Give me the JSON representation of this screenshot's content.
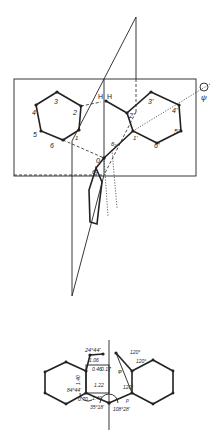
{
  "figure": {
    "top": {
      "labels_left_ring": [
        "2",
        "3",
        "4",
        "5",
        "6",
        "1"
      ],
      "labels_right_ring": [
        "2'",
        "3'",
        "4'",
        "5'",
        "6'",
        "1'"
      ],
      "hydrogen_labels": [
        "H",
        "H"
      ],
      "axis_symbol": "ψ",
      "oxygen_label": "0",
      "lower_ring_labels": [
        "6₁",
        "6₂"
      ]
    },
    "bottom": {
      "angles": [
        "24°44'",
        "84°44'",
        "35°18'",
        "108°28'",
        "120°",
        "120°",
        "120°"
      ],
      "distances": [
        "1.06",
        "1.40",
        "0.46",
        "0.17",
        "1.22",
        "0.70",
        "1.40"
      ],
      "misc": [
        "p",
        "φ"
      ]
    }
  }
}
